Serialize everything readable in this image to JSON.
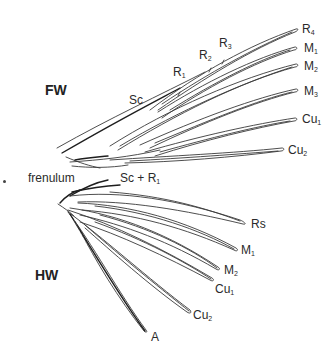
{
  "diagram": {
    "forewing": {
      "label": "FW",
      "veins": [
        {
          "name": "R",
          "sub": "4"
        },
        {
          "name": "M",
          "sub": "1"
        },
        {
          "name": "M",
          "sub": "2"
        },
        {
          "name": "M",
          "sub": "3"
        },
        {
          "name": "Cu",
          "sub": "1"
        },
        {
          "name": "Cu",
          "sub": "2"
        }
      ],
      "costal_labels": [
        {
          "name": "Sc",
          "sub": ""
        },
        {
          "name": "R",
          "sub": "1"
        },
        {
          "name": "R",
          "sub": "2"
        },
        {
          "name": "R",
          "sub": "3"
        }
      ]
    },
    "frenulum_label": "frenulum",
    "hindwing": {
      "label": "HW",
      "base_label": {
        "name": "Sc + R",
        "sub": "1"
      },
      "veins": [
        {
          "name": "Rs",
          "sub": ""
        },
        {
          "name": "M",
          "sub": "1"
        },
        {
          "name": "M",
          "sub": "2"
        },
        {
          "name": "Cu",
          "sub": "1"
        },
        {
          "name": "Cu",
          "sub": "2"
        },
        {
          "name": "A",
          "sub": ""
        }
      ]
    },
    "colors": {
      "background": "#ffffff",
      "line": "#3a3a3a",
      "text": "#2a2a2a"
    }
  }
}
